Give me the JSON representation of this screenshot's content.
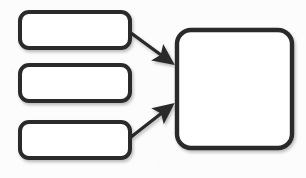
{
  "diagram": {
    "type": "flowchart",
    "canvas": {
      "width": 306,
      "height": 178,
      "background": "#fcfcfc"
    },
    "style": {
      "stroke_color": "#2b2b2b",
      "node_fill": "#ffffff",
      "stroke_width": 4,
      "arrow_stroke_width": 3,
      "shadow_color": "rgba(0,0,0,0.22)"
    },
    "nodes": [
      {
        "id": "box-top-left",
        "name": "input-box-1",
        "label": "",
        "shape": "rounded-rectangle",
        "x": 20,
        "y": 12,
        "width": 110,
        "height": 36,
        "radius": 9
      },
      {
        "id": "box-middle-left",
        "name": "input-box-2",
        "label": "",
        "shape": "rounded-rectangle",
        "x": 20,
        "y": 65,
        "width": 110,
        "height": 36,
        "radius": 9
      },
      {
        "id": "box-bottom-left",
        "name": "input-box-3",
        "label": "",
        "shape": "rounded-rectangle",
        "x": 20,
        "y": 122,
        "width": 110,
        "height": 36,
        "radius": 9
      },
      {
        "id": "box-right",
        "name": "output-box",
        "label": "",
        "shape": "rounded-square",
        "x": 177,
        "y": 30,
        "width": 115,
        "height": 118,
        "radius": 14
      }
    ],
    "connectors": [
      {
        "id": "arrow-1",
        "name": "arrow-input-1-to-output",
        "label": "",
        "from": "box-top-left",
        "to": "box-right",
        "direction": "down-right",
        "x1": 131,
        "y1": 33,
        "x2": 172,
        "y2": 63
      },
      {
        "id": "arrow-2",
        "name": "arrow-input-2-to-output",
        "label": "",
        "from": "box-middle-left",
        "to": "box-right",
        "direction": "horizontal",
        "x1": 131,
        "y1": 84,
        "x2": 173,
        "y2": 84
      },
      {
        "id": "arrow-3",
        "name": "arrow-input-3-to-output",
        "label": "",
        "from": "box-bottom-left",
        "to": "box-right",
        "direction": "up-right",
        "x1": 131,
        "y1": 137,
        "x2": 172,
        "y2": 105
      }
    ]
  }
}
